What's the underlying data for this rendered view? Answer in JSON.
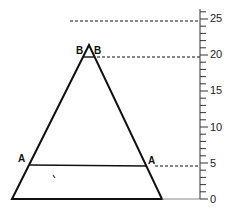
{
  "diagram": {
    "type": "triangle-with-height-scale",
    "triangle": {
      "apex": [
        89,
        45
      ],
      "base_left": [
        12,
        199
      ],
      "base_right": [
        162,
        199
      ]
    },
    "labels": {
      "b_left": "B",
      "b_right": "B",
      "a_left": "A",
      "a_right": "A"
    },
    "lines": {
      "bb_level": 19.5,
      "aa_level": 4.7,
      "top_dashed_level": 24.5
    },
    "axis": {
      "min": 0,
      "max": 26,
      "major_step": 5,
      "minor_step": 1,
      "tick_labels": [
        "0",
        "5",
        "10",
        "15",
        "20",
        "25"
      ]
    },
    "colors": {
      "stroke": "#111111",
      "axis": "#333333",
      "background": "#ffffff"
    }
  }
}
